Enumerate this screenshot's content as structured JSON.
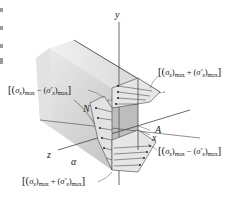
{
  "figure": {
    "type": "stress-distribution-diagram",
    "axes": {
      "x": "x",
      "y": "y",
      "z": "z"
    },
    "points": {
      "A": "A",
      "N": "N"
    },
    "angle": "α",
    "annotations": {
      "top_left": {
        "open": "[(",
        "sigma": "σ",
        "sub_x": "x",
        "close_paren": ")",
        "sub_max": "max",
        "op": " − (",
        "sigma_prime": "σ′",
        "sub_x2": "x",
        "close": ")",
        "sub_max2": "max",
        "end": "]"
      },
      "top_right": {
        "open": "[(",
        "sigma": "σ",
        "sub_x": "x",
        "close_paren": ")",
        "sub_max": "max",
        "op": " + (",
        "sigma_prime": "σ′",
        "sub_x2": "x",
        "close": ")",
        "sub_max2": "max",
        "end": "]"
      },
      "bottom_right": {
        "open": "[(",
        "sigma": "σ",
        "sub_x": "x",
        "close_paren": ")",
        "sub_max": "max",
        "op": " − (",
        "sigma_prime": "σ′",
        "sub_x2": "x",
        "close": ")",
        "sub_max2": "max",
        "end": "]"
      },
      "bottom_left": {
        "open": "[(",
        "sigma": "σ",
        "sub_x": "x",
        "close_paren": ")",
        "sub_max": "max",
        "op": " + (",
        "sigma_prime": "σ′",
        "sub_x2": "x",
        "close": ")",
        "sub_max2": "max",
        "end": "]"
      }
    },
    "colors": {
      "block_face": "#c9c9c9",
      "block_top": "#dedede",
      "block_side": "#b5b5b5",
      "hatch_fill": "#e4e4e4",
      "lines": "#333333",
      "axis": "#555555"
    }
  }
}
